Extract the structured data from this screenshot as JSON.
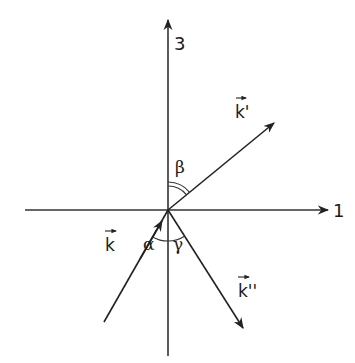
{
  "figure": {
    "axes": {
      "horizontal_label": "1",
      "vertical_label": "3"
    },
    "vectors": {
      "incident_label": "k",
      "reflected_label": "k'",
      "transmitted_label": "k''"
    },
    "angles": {
      "incident": "α",
      "reflected": "β",
      "transmitted": "γ"
    },
    "colors": {
      "line": "#222222",
      "background": "#ffffff"
    }
  }
}
